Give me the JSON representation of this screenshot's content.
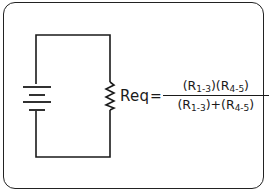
{
  "diagram": {
    "type": "circuit",
    "components": [
      {
        "id": "battery",
        "kind": "battery-source",
        "icon": "battery-icon",
        "plates": 4
      },
      {
        "id": "resistor",
        "kind": "equivalent-resistor",
        "icon": "resistor-icon",
        "label": "Req"
      }
    ],
    "formula": {
      "lhs": "Req",
      "equals": "=",
      "numerator": {
        "term1": {
          "open": "(R",
          "sub": "1-3",
          "close": ")"
        },
        "term2": {
          "open": "(R",
          "sub": "4-5",
          "close": ")"
        }
      },
      "denominator": {
        "term1": {
          "open": "(R",
          "sub": "1-3",
          "close": ")"
        },
        "operator": "+",
        "term2": {
          "open": "(R",
          "sub": "4-5",
          "close": ")"
        }
      }
    },
    "colors": {
      "line": "#1a1a1a",
      "background": "#ffffff"
    }
  }
}
